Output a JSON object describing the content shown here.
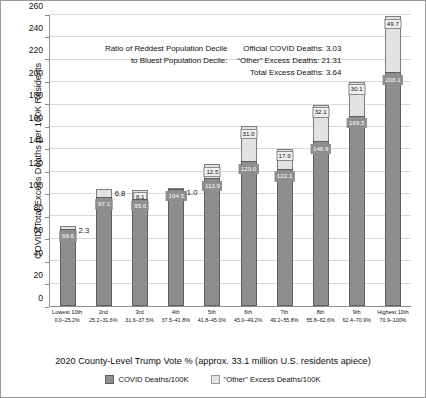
{
  "chart_data": {
    "type": "bar",
    "subtype": "stacked-vertical",
    "title": "",
    "xlabel": "2020 County-Level Trump Vote % (approx. 33.1 million U.S. residents apiece)",
    "ylabel": "COVID/Total Excess Deaths per 100K Residents",
    "ylim": [
      0,
      260
    ],
    "ytick_step": 20,
    "yticks": [
      0,
      20,
      40,
      60,
      80,
      100,
      120,
      140,
      160,
      180,
      200,
      220,
      240,
      260
    ],
    "grid": true,
    "legend_position": "bottom",
    "categories": [
      "Lowest 10th",
      "2nd",
      "3rd",
      "4th",
      "5th",
      "6th",
      "7th",
      "8th",
      "9th",
      "Highest 10th"
    ],
    "category_ranges": [
      "0.0–25.2%",
      "25.2–31.6%",
      "31.6–37.5%",
      "37.5–41.8%",
      "41.8–45.0%",
      "45.0–49.2%",
      "49.2–55.8%",
      "55.8–62.6%",
      "62.4–70.9%",
      "70.9–100%"
    ],
    "series": [
      {
        "name": "COVID Deaths/100K",
        "color": "#8e8e8e",
        "values": [
          68.6,
          97.1,
          95.6,
          104.5,
          113.9,
          129.0,
          122.1,
          146.9,
          169.5,
          208.1
        ]
      },
      {
        "name": "\"Other\" Excess Deaths/100K",
        "color": "#e2e2e2",
        "values": [
          2.3,
          6.8,
          8.1,
          1.0,
          12.5,
          31.0,
          17.9,
          32.1,
          30.1,
          49.7
        ]
      }
    ],
    "annotations": {
      "ratio_label_line1": "Ratio of Reddest Population Decile",
      "ratio_label_line2": "to Bluest Population Decile:",
      "stat_line1": "Official COVID Deaths: 3.03",
      "stat_line2": "“Other” Excess Deaths: 21.31",
      "stat_line3": "Total Excess Deaths: 3.64"
    }
  }
}
